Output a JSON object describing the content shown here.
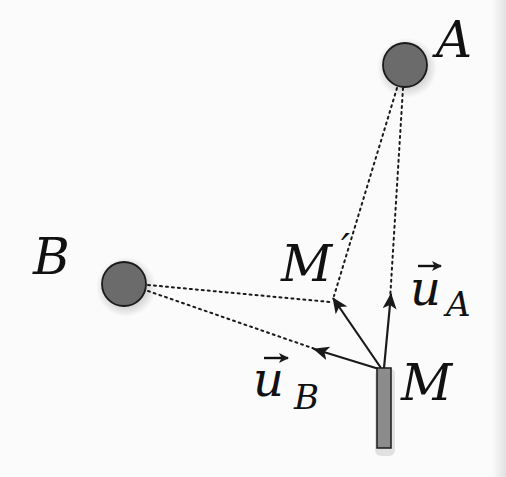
{
  "diagram": {
    "background_color": "#fbfbfb",
    "colors": {
      "circle_fill": "#6b6b6b",
      "circle_stroke": "#1a1a1a",
      "sensor_fill": "#8c8c8c",
      "sensor_stroke": "#1a1a1a",
      "line_color": "#1a1a1a",
      "label_color": "#111111"
    },
    "points": {
      "A": {
        "label": "A",
        "cx": 405,
        "cy": 65,
        "r": 23
      },
      "B": {
        "label": "B",
        "cx": 124,
        "cy": 284,
        "r": 23
      },
      "M": {
        "label": "M",
        "x": 377,
        "y": 368,
        "width": 14,
        "height": 80
      },
      "M_prime": {
        "label": "M",
        "prime": "′"
      }
    },
    "vectors": {
      "u_A": {
        "symbol": "u",
        "subscript": "A"
      },
      "u_B": {
        "symbol": "u",
        "subscript": "B"
      }
    }
  }
}
